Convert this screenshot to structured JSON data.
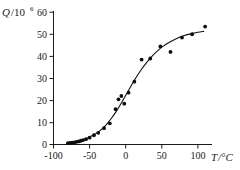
{
  "chart_data": {
    "type": "scatter",
    "title": "",
    "xlabel": "T/°C",
    "ylabel": "Q/10⁶",
    "ylabel_symbol": "Q",
    "ylabel_divisor_base": "/10",
    "ylabel_divisor_exponent": "6",
    "xlabel_symbol": "T",
    "xlabel_unit": "/°C",
    "xlim": [
      -100,
      120
    ],
    "ylim": [
      0,
      62
    ],
    "grid": false,
    "legend": null,
    "xticks": [
      -100,
      -50,
      0,
      50,
      100
    ],
    "xtick_labels": [
      "-100",
      "-50",
      "0",
      "50",
      "100"
    ],
    "yticks": [
      0,
      10,
      20,
      30,
      40,
      50,
      60
    ],
    "ytick_labels": [
      "0",
      "10",
      "20",
      "30",
      "40",
      "50",
      "60"
    ],
    "series": [
      {
        "name": "measured",
        "marker": "filled-circle",
        "color": "#0d0d0d",
        "x": [
          -80,
          -77,
          -74,
          -71,
          -68,
          -65,
          -62,
          -59,
          -55,
          -50,
          -44,
          -38,
          -30,
          -22,
          -14,
          -10,
          -6,
          -2,
          4,
          12,
          22,
          34,
          48,
          62,
          78,
          92,
          110
        ],
        "y": [
          0.6,
          0.7,
          0.8,
          1.0,
          1.2,
          1.4,
          1.7,
          2.0,
          2.4,
          3.1,
          4.2,
          5.3,
          7.4,
          9.6,
          16.0,
          20.5,
          22.0,
          18.5,
          23.5,
          28.5,
          38.5,
          39.0,
          44.5,
          42.0,
          48.5,
          50.0,
          53.5
        ]
      }
    ],
    "fit_curve": {
      "name": "sigmoid fit",
      "color": "#111111",
      "x": [
        -82,
        -75,
        -68,
        -60,
        -52,
        -44,
        -36,
        -28,
        -20,
        -12,
        -4,
        4,
        12,
        20,
        28,
        36,
        44,
        52,
        60,
        70,
        80,
        90,
        100,
        108
      ],
      "y": [
        0.5,
        0.9,
        1.4,
        2.1,
        3.1,
        4.4,
        6.2,
        8.6,
        11.8,
        15.6,
        20.0,
        24.6,
        29.1,
        33.2,
        36.8,
        39.9,
        42.5,
        44.6,
        46.3,
        48.0,
        49.3,
        50.2,
        50.9,
        51.3
      ]
    }
  },
  "axes": {
    "y_label_parts": {
      "symbol": "Q",
      "slash_base": "/10",
      "exponent": "6"
    },
    "x_label_parts": {
      "symbol": "T",
      "unit": "/°C"
    }
  }
}
